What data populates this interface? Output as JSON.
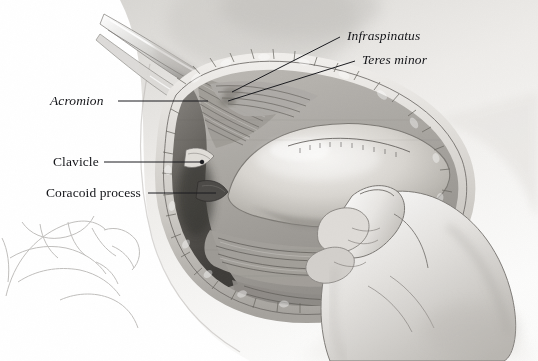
{
  "figure": {
    "width": 538,
    "height": 361,
    "background_color": "#ffffff",
    "medium": "grayscale pencil and wash medical illustration"
  },
  "labels": [
    {
      "id": "infraspinatus",
      "text": "Infraspinatus",
      "style": "italic",
      "x": 347,
      "y": 29,
      "leader": {
        "x1": 340,
        "y1": 37,
        "x2": 232,
        "y2": 92
      }
    },
    {
      "id": "teres-minor",
      "text": "Teres minor",
      "style": "italic",
      "x": 362,
      "y": 53,
      "leader": {
        "x1": 355,
        "y1": 61,
        "x2": 228,
        "y2": 101
      }
    },
    {
      "id": "acromion",
      "text": "Acromion",
      "style": "italic",
      "x": 50,
      "y": 94,
      "leader": {
        "x1": 118,
        "y1": 101,
        "x2": 208,
        "y2": 101
      }
    },
    {
      "id": "clavicle",
      "text": "Clavicle",
      "style": "roman",
      "x": 53,
      "y": 155,
      "leader": {
        "x1": 104,
        "y1": 162,
        "x2": 202,
        "y2": 162
      }
    },
    {
      "id": "coracoid-process",
      "text": "Coracoid process",
      "style": "roman",
      "x": 46,
      "y": 186,
      "leader": {
        "x1": 148,
        "y1": 193,
        "x2": 216,
        "y2": 193
      }
    }
  ],
  "colors": {
    "label_text": "#15161a",
    "leader_line": "#1a1b1f",
    "skin_light": "#f2f1ef",
    "skin_mid": "#d9d7d3",
    "skin_shadow": "#a9a7a3",
    "tissue_mid": "#b5b2ad",
    "tissue_dark": "#6e6b67",
    "bone_light": "#e8e6e2",
    "deep_shadow": "#3a3936",
    "metal_retractor": "#cfcecb"
  },
  "anatomy_regions": [
    {
      "id": "torso-shoulder",
      "description": "patient's torso and upper arm, soft grey tonal wash"
    },
    {
      "id": "retractor-instrument",
      "description": "curved metal retractor lifting the deltoid superiorly"
    },
    {
      "id": "deltoid-muscle",
      "description": "retracted deltoid muscle fibers at upper left of wound"
    },
    {
      "id": "humeral-head",
      "description": "large smooth ovoid articular surface of the humeral head at center"
    },
    {
      "id": "rotator-cuff-tendons",
      "description": "infraspinatus and teres minor tendon insertions posterosuperiorly"
    },
    {
      "id": "clavicle-bone",
      "description": "clavicle at left margin of the exposure"
    },
    {
      "id": "coracoid-bone",
      "description": "coracoid process below the clavicle"
    },
    {
      "id": "wound-edge-fat",
      "description": "lobulated subcutaneous fat along the skin incision margin"
    },
    {
      "id": "surgeons-hand",
      "description": "gloved surgeon's hand and fingers retracting tissue at right"
    },
    {
      "id": "assistant-hand-sketch",
      "description": "faint pencil sketch of a second hand at lower left"
    }
  ]
}
